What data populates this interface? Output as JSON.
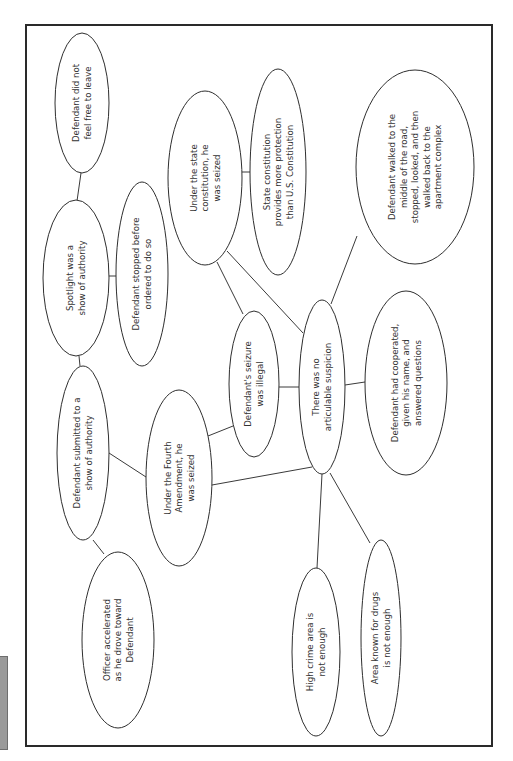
{
  "diagram": {
    "type": "concept-map",
    "orientation": "rotated-90-ccw",
    "colors": {
      "stroke": "#2e2e2e",
      "text": "#333333",
      "background": "#ffffff",
      "side_tab": "#9a9a9a"
    },
    "nodes": [
      {
        "id": "n1",
        "lines": [
          "Defendant did not",
          "feel free to leave"
        ],
        "cx": 82,
        "cy": 103,
        "rx": 27,
        "ry": 70
      },
      {
        "id": "n2",
        "lines": [
          "Spotlight was a",
          "show of authority"
        ],
        "cx": 76,
        "cy": 278,
        "rx": 33,
        "ry": 78
      },
      {
        "id": "n3",
        "lines": [
          "Defendant stopped before",
          "ordered to do so"
        ],
        "cx": 142,
        "cy": 274,
        "rx": 26,
        "ry": 92
      },
      {
        "id": "n4",
        "lines": [
          "Under the state",
          "constitution, he",
          "was seized"
        ],
        "cx": 205,
        "cy": 178,
        "rx": 37,
        "ry": 87
      },
      {
        "id": "n5",
        "lines": [
          "State constitution",
          "provides more protection",
          "than U.S. Constitution"
        ],
        "cx": 278,
        "cy": 172,
        "rx": 28,
        "ry": 103
      },
      {
        "id": "n6",
        "lines": [
          "Defendant walked to the",
          "middle of the road,",
          "stopped, looked, and then",
          "walked back to the",
          "apartment complex"
        ],
        "cx": 415,
        "cy": 167,
        "rx": 59,
        "ry": 97
      },
      {
        "id": "n7",
        "lines": [
          "Defendant's seizure",
          "was illegal"
        ],
        "cx": 254,
        "cy": 384,
        "rx": 25,
        "ry": 73
      },
      {
        "id": "n8",
        "lines": [
          "There was no",
          "articulable suspicion"
        ],
        "cx": 322,
        "cy": 387,
        "rx": 23,
        "ry": 87
      },
      {
        "id": "n9",
        "lines": [
          "Defendant had cooperated,",
          "given his name, and",
          "answered questions"
        ],
        "cx": 406,
        "cy": 383,
        "rx": 41,
        "ry": 92
      },
      {
        "id": "n10",
        "lines": [
          "Defendant submitted to a",
          "show of authority"
        ],
        "cx": 83,
        "cy": 453,
        "rx": 26,
        "ry": 87
      },
      {
        "id": "n11",
        "lines": [
          "Under the Fourth",
          "Amendment, he",
          "was seized"
        ],
        "cx": 179,
        "cy": 478,
        "rx": 33,
        "ry": 88
      },
      {
        "id": "n12",
        "lines": [
          "Officer accelerated",
          "as he drove toward",
          "Defendant"
        ],
        "cx": 118,
        "cy": 640,
        "rx": 36,
        "ry": 88
      },
      {
        "id": "n13",
        "lines": [
          "High crime area is",
          "not enough"
        ],
        "cx": 316,
        "cy": 652,
        "rx": 24,
        "ry": 84
      },
      {
        "id": "n14",
        "lines": [
          "Area known for drugs",
          "is not enough"
        ],
        "cx": 381,
        "cy": 638,
        "rx": 20,
        "ry": 98
      }
    ],
    "edges": [
      {
        "from": "n1",
        "to": "n2",
        "x1": 81,
        "y1": 173,
        "x2": 77,
        "y2": 201
      },
      {
        "from": "n2",
        "to": "n3",
        "x1": 109,
        "y1": 276,
        "x2": 116,
        "y2": 276
      },
      {
        "from": "n2",
        "to": "n10",
        "x1": 79,
        "y1": 356,
        "x2": 80,
        "y2": 366
      },
      {
        "from": "n4",
        "to": "n5",
        "x1": 242,
        "y1": 172,
        "x2": 250,
        "y2": 172
      },
      {
        "from": "n4",
        "to": "n7",
        "x1": 217,
        "y1": 262,
        "x2": 243,
        "y2": 314
      },
      {
        "from": "n4",
        "to": "n8",
        "x1": 227,
        "y1": 251,
        "x2": 303,
        "y2": 333
      },
      {
        "from": "n6",
        "to": "n8",
        "x1": 357,
        "y1": 236,
        "x2": 331,
        "y2": 304
      },
      {
        "from": "n7",
        "to": "n8",
        "x1": 279,
        "y1": 387,
        "x2": 299,
        "y2": 387
      },
      {
        "from": "n8",
        "to": "n9",
        "x1": 345,
        "y1": 385,
        "x2": 365,
        "y2": 382
      },
      {
        "from": "n10",
        "to": "n11",
        "x1": 109,
        "y1": 453,
        "x2": 146,
        "y2": 477
      },
      {
        "from": "n10",
        "to": "n12",
        "x1": 93,
        "y1": 540,
        "x2": 104,
        "y2": 554
      },
      {
        "from": "n11",
        "to": "n7",
        "x1": 208,
        "y1": 436,
        "x2": 233,
        "y2": 426
      },
      {
        "from": "n11",
        "to": "n8",
        "x1": 212,
        "y1": 485,
        "x2": 312,
        "y2": 467
      },
      {
        "from": "n8",
        "to": "n13",
        "x1": 322,
        "y1": 474,
        "x2": 317,
        "y2": 568
      },
      {
        "from": "n8",
        "to": "n14",
        "x1": 330,
        "y1": 473,
        "x2": 370,
        "y2": 543
      }
    ]
  }
}
